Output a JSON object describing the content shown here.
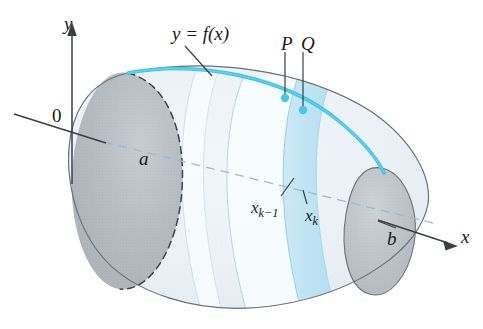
{
  "figure": {
    "background_color": "#ffffff",
    "axes": {
      "y_axis_label": "y",
      "x_axis_label": "x",
      "origin_label": "0"
    },
    "curve": {
      "label": "y = f(x)",
      "color": "#3bc3e8",
      "ink_color": "#2fb6de"
    },
    "points": {
      "p_label": "P",
      "q_label": "Q",
      "dot_color": "#45c8ec"
    },
    "bounds": {
      "left_cap_label": "a",
      "right_cap_label": "b"
    },
    "partition": {
      "left_tick_base": "x",
      "left_tick_sub": "k−1",
      "right_tick_base": "x",
      "right_tick_sub": "k"
    },
    "colors": {
      "body_fill": "#eef3f7",
      "body_fill_mid": "#e3ebf2",
      "left_cap_fill": "#b9bfc4",
      "right_cap_fill": "#c2c7cb",
      "band_light": "#f4fbfe",
      "band_dark": "#bfe4f4",
      "outline": "#5a5f63",
      "dashed_axis": "#9fb9cc",
      "text": "#1a1a1a"
    }
  }
}
